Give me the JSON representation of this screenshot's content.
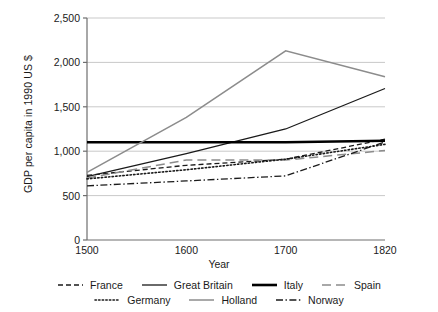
{
  "chart_data": {
    "type": "line",
    "title": "",
    "xlabel": "Year",
    "ylabel": "GDP per capita in 1990 US $",
    "categories": [
      "1500",
      "1600",
      "1700",
      "1820"
    ],
    "x": [
      1500,
      1600,
      1700,
      1820
    ],
    "ylim": [
      0,
      2500
    ],
    "yticks": [
      0,
      500,
      1000,
      1500,
      2000,
      2500
    ],
    "ytick_labels": [
      "0",
      "500",
      "1,000",
      "1,500",
      "2,000",
      "2,500"
    ],
    "grid": "horizontal",
    "legend_position": "bottom",
    "series": [
      {
        "name": "France",
        "values": [
          727,
          841,
          910,
          1135
        ],
        "color": "#1a1a1a",
        "style": "dashed",
        "width": 1.3,
        "dash": "5,3"
      },
      {
        "name": "Great Britain",
        "values": [
          714,
          974,
          1250,
          1706
        ],
        "color": "#1a1a1a",
        "style": "solid",
        "width": 1.3,
        "dash": ""
      },
      {
        "name": "Italy",
        "values": [
          1100,
          1100,
          1100,
          1117
        ],
        "color": "#000000",
        "style": "solid-thick",
        "width": 2.6,
        "dash": ""
      },
      {
        "name": "Spain",
        "values": [
          698,
          900,
          900,
          1008
        ],
        "color": "#8c8c8c",
        "style": "long-dash",
        "width": 1.5,
        "dash": "9,5"
      },
      {
        "name": "Germany",
        "values": [
          688,
          791,
          910,
          1077
        ],
        "color": "#1a1a1a",
        "style": "dotted",
        "width": 1.6,
        "dash": "1.4,2.2"
      },
      {
        "name": "Holland",
        "values": [
          761,
          1381,
          2130,
          1838
        ],
        "color": "#8c8c8c",
        "style": "solid",
        "width": 1.5,
        "dash": ""
      },
      {
        "name": "Norway",
        "values": [
          610,
          665,
          722,
          1104
        ],
        "color": "#1a1a1a",
        "style": "dash-dot",
        "width": 1.3,
        "dash": "7,2.5,1.4,2.5"
      }
    ],
    "legend_rows": [
      [
        "France",
        "Great Britain",
        "Italy",
        "Spain"
      ],
      [
        "Germany",
        "Holland",
        "Norway"
      ]
    ]
  },
  "axis": {
    "y_title": "GDP per capita in 1990 US $",
    "x_title": "Year"
  }
}
